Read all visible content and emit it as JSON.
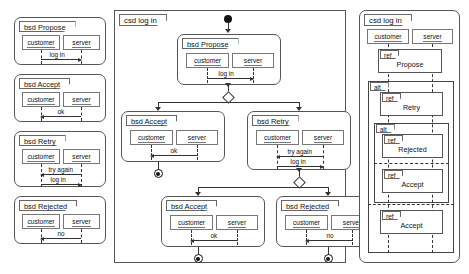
{
  "diagram": {
    "roles": {
      "customer": "customer",
      "server": "server"
    },
    "keywords": {
      "bsd": "bsd",
      "csd": "csd",
      "ref": "ref",
      "alt": "alt"
    }
  },
  "left_panel": {
    "name": "basic-sequence-diagrams-column",
    "diagrams": [
      {
        "label": "bsd Propose",
        "roles": [
          "customer",
          "server"
        ],
        "messages": [
          {
            "text": "log in",
            "from": "customer",
            "to": "server",
            "direction": "right"
          }
        ]
      },
      {
        "label": "bsd Accept",
        "roles": [
          "customer",
          "server"
        ],
        "messages": [
          {
            "text": "ok",
            "from": "server",
            "to": "customer",
            "direction": "left"
          }
        ]
      },
      {
        "label": "bsd Retry",
        "roles": [
          "customer",
          "server"
        ],
        "messages": [
          {
            "text": "try again",
            "from": "server",
            "to": "customer",
            "direction": "left"
          },
          {
            "text": "log in",
            "from": "customer",
            "to": "server",
            "direction": "right"
          }
        ]
      },
      {
        "label": "bsd Rejected",
        "roles": [
          "customer",
          "server"
        ],
        "messages": [
          {
            "text": "no",
            "from": "server",
            "to": "customer",
            "direction": "left"
          }
        ]
      }
    ]
  },
  "middle_panel": {
    "name": "causal-sequence-diagram",
    "label": "csd log in",
    "nodes": [
      {
        "id": "start",
        "type": "initial-node"
      },
      {
        "id": "propose",
        "type": "bsd",
        "label": "bsd Propose",
        "messages": [
          {
            "text": "log in",
            "direction": "right"
          }
        ]
      },
      {
        "id": "choice1",
        "type": "decision-node"
      },
      {
        "id": "accept1",
        "type": "bsd",
        "label": "bsd Accept",
        "messages": [
          {
            "text": "ok",
            "direction": "left"
          }
        ]
      },
      {
        "id": "retry",
        "type": "bsd",
        "label": "bsd Retry",
        "messages": [
          {
            "text": "try again",
            "direction": "left"
          },
          {
            "text": "log in",
            "direction": "right"
          }
        ]
      },
      {
        "id": "choice2",
        "type": "decision-node"
      },
      {
        "id": "accept2",
        "type": "bsd",
        "label": "bsd Accept",
        "messages": [
          {
            "text": "ok",
            "direction": "left"
          }
        ]
      },
      {
        "id": "rejected",
        "type": "bsd",
        "label": "bsd Rejected",
        "messages": [
          {
            "text": "no",
            "direction": "left"
          }
        ]
      },
      {
        "id": "end1",
        "type": "final-node"
      },
      {
        "id": "end2",
        "type": "final-node"
      },
      {
        "id": "end3",
        "type": "final-node"
      }
    ]
  },
  "right_panel": {
    "name": "combined-fragment-diagram",
    "label": "csd log in",
    "roles": [
      "customer",
      "server"
    ],
    "fragments": [
      {
        "kind": "ref",
        "label": "ref",
        "name": "Propose",
        "level": 0
      },
      {
        "kind": "alt",
        "label": "alt",
        "level": 0,
        "operands": [
          {
            "items": [
              {
                "kind": "ref",
                "label": "ref",
                "name": "Retry"
              },
              {
                "kind": "alt",
                "label": "alt",
                "operands": [
                  {
                    "items": [
                      {
                        "kind": "ref",
                        "label": "ref",
                        "name": "Rejected"
                      }
                    ]
                  },
                  {
                    "items": [
                      {
                        "kind": "ref",
                        "label": "ref",
                        "name": "Accept"
                      }
                    ]
                  }
                ]
              }
            ]
          },
          {
            "items": [
              {
                "kind": "ref",
                "label": "ref",
                "name": "Accept"
              }
            ]
          }
        ]
      }
    ]
  }
}
